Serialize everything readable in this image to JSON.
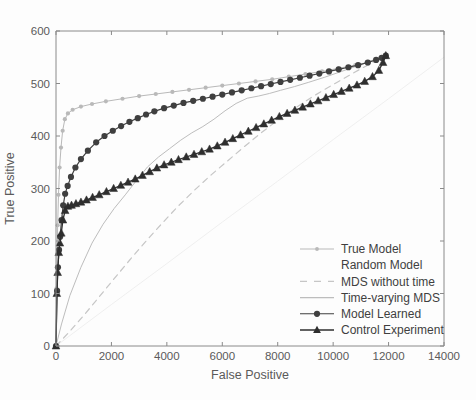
{
  "figure": {
    "background_color": "#fdfdfd",
    "axis_color": "#8a8a8a",
    "text_color": "#5a5a5a"
  },
  "chart_data": {
    "type": "line",
    "title": "",
    "xlabel": "False Positive",
    "ylabel": "True Positive",
    "xlim": [
      0,
      14000
    ],
    "ylim": [
      0,
      600
    ],
    "xticks": [
      0,
      2000,
      4000,
      6000,
      8000,
      10000,
      12000,
      14000
    ],
    "yticks": [
      0,
      100,
      200,
      300,
      400,
      500,
      600
    ],
    "xtick_labels": [
      "0",
      "2000",
      "4000",
      "6000",
      "8000",
      "10000",
      "12000",
      "14000"
    ],
    "ytick_labels": [
      "0",
      "100",
      "200",
      "300",
      "400",
      "500",
      "600"
    ],
    "grid": false,
    "legend_position": "lower right",
    "series": [
      {
        "name": "True Model",
        "color": "#b9b9b9",
        "line_style": "solid",
        "line_width": 1,
        "marker": "dot",
        "marker_size": 2.1,
        "x": [
          0,
          20,
          40,
          60,
          90,
          130,
          180,
          240,
          320,
          430,
          600,
          900,
          1300,
          1800,
          2400,
          3000,
          3600,
          4200,
          4800,
          5400,
          6000,
          6600,
          7200,
          7800,
          8400,
          9000,
          9600,
          10200,
          10800,
          11300,
          11700,
          11900
        ],
        "y": [
          0,
          110,
          175,
          230,
          288,
          340,
          378,
          410,
          432,
          443,
          450,
          456,
          461,
          466,
          471,
          476,
          480,
          484,
          488,
          492,
          496,
          500,
          504,
          508,
          513,
          518,
          523,
          529,
          535,
          541,
          548,
          553
        ]
      },
      {
        "name": "Random Model",
        "color": "#ededed",
        "line_style": "solid",
        "line_width": 0.9,
        "marker": "none",
        "marker_size": 0,
        "x": [
          0,
          2000,
          4000,
          6000,
          8000,
          10000,
          12000,
          14000
        ],
        "y": [
          0,
          79,
          157,
          236,
          314,
          393,
          471,
          550
        ]
      },
      {
        "name": "MDS without time",
        "color": "#c6c6c6",
        "line_style": "dashed",
        "line_width": 1.2,
        "marker": "none",
        "marker_size": 0,
        "x": [
          0,
          500,
          1000,
          1500,
          2000,
          2600,
          3200,
          3800,
          4400,
          5000,
          5600,
          6200,
          6800,
          7400,
          8000,
          8600,
          9200,
          9800,
          10400,
          11000,
          11500,
          11900
        ],
        "y": [
          0,
          28,
          58,
          90,
          122,
          160,
          197,
          232,
          266,
          297,
          326,
          353,
          380,
          406,
          430,
          452,
          473,
          492,
          510,
          528,
          542,
          553
        ]
      },
      {
        "name": "Time-varying MDS",
        "color": "#bdbdbd",
        "line_style": "solid",
        "line_width": 1,
        "marker": "none",
        "marker_size": 0,
        "x": [
          0,
          200,
          500,
          900,
          1300,
          1700,
          2100,
          2500,
          2900,
          3300,
          3700,
          4100,
          4500,
          4900,
          5300,
          5700,
          6100,
          6500,
          6900,
          7300,
          7700,
          8100,
          8600,
          9100,
          9700,
          10300,
          10900,
          11400,
          11900
        ],
        "y": [
          0,
          42,
          96,
          150,
          196,
          232,
          262,
          288,
          315,
          341,
          360,
          376,
          392,
          406,
          418,
          432,
          448,
          462,
          472,
          476,
          481,
          487,
          494,
          502,
          512,
          523,
          534,
          544,
          553
        ]
      },
      {
        "name": "Model Learned",
        "color": "#3f3f3f",
        "line_style": "solid",
        "line_width": 1.2,
        "marker": "circle",
        "marker_size": 3.1,
        "x": [
          0,
          40,
          70,
          110,
          150,
          200,
          260,
          330,
          420,
          540,
          700,
          900,
          1150,
          1450,
          1750,
          2050,
          2350,
          2650,
          2950,
          3250,
          3550,
          3900,
          4250,
          4600,
          4950,
          5300,
          5650,
          6000,
          6350,
          6700,
          7050,
          7400,
          7750,
          8100,
          8450,
          8800,
          9150,
          9500,
          9850,
          10200,
          10550,
          10900,
          11250,
          11550,
          11750,
          11900
        ],
        "y": [
          0,
          105,
          150,
          183,
          208,
          240,
          268,
          290,
          305,
          322,
          340,
          356,
          372,
          388,
          400,
          410,
          419,
          427,
          434,
          441,
          447,
          453,
          458,
          463,
          467,
          471,
          475,
          479,
          483,
          487,
          491,
          495,
          499,
          503,
          507,
          511,
          515,
          519,
          523,
          527,
          531,
          535,
          540,
          545,
          549,
          553
        ]
      },
      {
        "name": "Control Experiment",
        "color": "#2e2e2e",
        "line_style": "solid",
        "line_width": 1.3,
        "marker": "triangle",
        "marker_size": 4.2,
        "x": [
          0,
          30,
          60,
          100,
          140,
          190,
          250,
          330,
          430,
          560,
          720,
          900,
          1100,
          1320,
          1560,
          1820,
          2080,
          2340,
          2600,
          2860,
          3120,
          3380,
          3640,
          3900,
          4160,
          4420,
          4700,
          4980,
          5260,
          5540,
          5820,
          6100,
          6380,
          6660,
          6940,
          7220,
          7500,
          7780,
          8060,
          8340,
          8620,
          8900,
          9180,
          9460,
          9740,
          10020,
          10300,
          10580,
          10860,
          11140,
          11420,
          11650,
          11800,
          11900
        ],
        "y": [
          0,
          100,
          140,
          178,
          196,
          215,
          240,
          258,
          266,
          268,
          271,
          274,
          278,
          283,
          288,
          294,
          300,
          306,
          312,
          318,
          325,
          332,
          339,
          345,
          350,
          355,
          360,
          365,
          370,
          375,
          381,
          388,
          395,
          402,
          409,
          416,
          423,
          430,
          437,
          443,
          449,
          455,
          461,
          467,
          473,
          479,
          485,
          491,
          497,
          504,
          513,
          525,
          540,
          553
        ]
      }
    ]
  },
  "legend": {
    "entries": [
      {
        "label": "True Model",
        "sample": "line-dot",
        "color": "#b9b9b9"
      },
      {
        "label": "Random Model",
        "sample": "line-faint",
        "color": "#f4f4f4"
      },
      {
        "label": "MDS without time",
        "sample": "line-dashed",
        "color": "#c6c6c6"
      },
      {
        "label": "Time-varying MDS",
        "sample": "line-solid",
        "color": "#bdbdbd"
      },
      {
        "label": "Model Learned",
        "sample": "line-circle",
        "color": "#3f3f3f"
      },
      {
        "label": "Control Experiment",
        "sample": "line-triangle",
        "color": "#2e2e2e"
      }
    ]
  }
}
